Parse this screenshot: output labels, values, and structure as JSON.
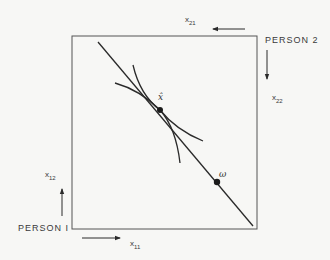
{
  "diagram": {
    "type": "edgeworth-box",
    "colors": {
      "line": "#2a2a2a",
      "box": "#555555",
      "text": "#3a3a3a",
      "background": "#f7f7f5"
    },
    "box": {
      "x": 72,
      "y": 36,
      "width": 185,
      "height": 193
    },
    "persons": {
      "person1": {
        "label": "PERSON I",
        "x": 18,
        "y": 231
      },
      "person2": {
        "label": "PERSON 2",
        "x": 265,
        "y": 43
      }
    },
    "axes": {
      "x11": {
        "base": "x",
        "sub": "11",
        "direction": "right"
      },
      "x12": {
        "base": "x",
        "sub": "12",
        "direction": "up"
      },
      "x21": {
        "base": "x",
        "sub": "21",
        "direction": "left"
      },
      "x22": {
        "base": "x",
        "sub": "22",
        "direction": "down"
      }
    },
    "points": {
      "xhat": {
        "label": "x̂",
        "x": 160,
        "y": 110
      },
      "omega": {
        "label": "ω",
        "x": 217,
        "y": 182
      }
    },
    "budget_line": {
      "from": [
        98,
        42
      ],
      "to": [
        253,
        226
      ]
    },
    "indifference_curves": [
      {
        "name": "steep-curve",
        "from": [
          133,
          65
        ],
        "through": [
          160,
          110
        ],
        "to": [
          180,
          163
        ]
      },
      {
        "name": "flat-curve",
        "from": [
          115,
          83
        ],
        "through": [
          160,
          110
        ],
        "to": [
          203,
          141
        ]
      }
    ]
  }
}
